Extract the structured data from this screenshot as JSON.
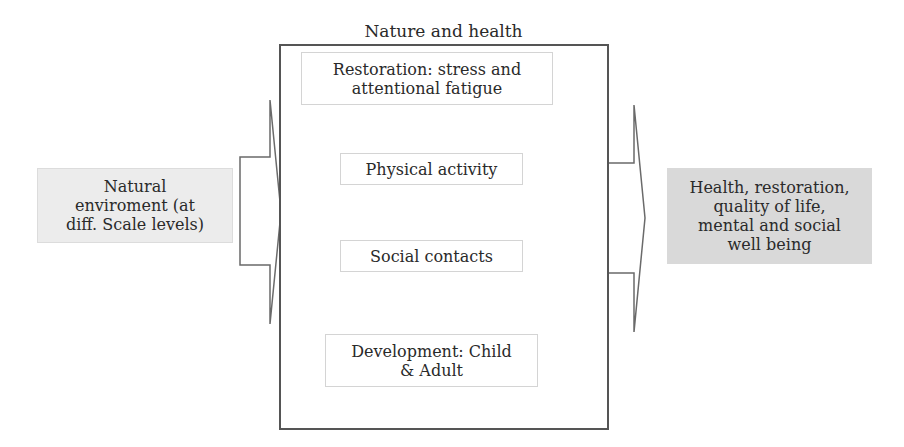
{
  "diagram": {
    "title": "Nature and health",
    "input": {
      "label": "Natural enviroment (at diff. Scale levels)",
      "lines": [
        "Natural",
        "enviroment (at",
        "diff. Scale levels)"
      ],
      "fill": "#ececec"
    },
    "mechanisms": [
      {
        "label": "Restoration: stress and attentional fatigue",
        "lines": [
          "Restoration: stress and",
          "attentional fatigue"
        ]
      },
      {
        "label": "Physical activity",
        "lines": [
          "Physical activity"
        ]
      },
      {
        "label": "Social contacts",
        "lines": [
          "Social contacts"
        ]
      },
      {
        "label": "Development: Child & Adult",
        "lines": [
          "Development: Child",
          "& Adult"
        ]
      }
    ],
    "output": {
      "label": "Health, restoration, quality of life, mental and social well being",
      "lines": [
        "Health, restoration,",
        "quality of life,",
        "mental and social",
        "well being"
      ],
      "fill": "#d9d9d9"
    },
    "arrows": [
      {
        "from": "input",
        "to": "mechanisms",
        "style": "block-arrow"
      },
      {
        "from": "mechanisms",
        "to": "output",
        "style": "block-arrow"
      }
    ],
    "colors": {
      "border": "#555555",
      "inner_border": "#d4d4d4",
      "text": "#2a2a2a"
    }
  }
}
